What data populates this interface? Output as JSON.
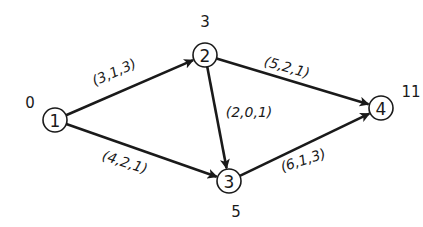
{
  "diagram": {
    "type": "activity-network",
    "nodes": [
      {
        "id": "1",
        "label": "1",
        "time": "0",
        "cx": 55,
        "cy": 120,
        "tx": 30,
        "ty": 103
      },
      {
        "id": "2",
        "label": "2",
        "time": "3",
        "cx": 205,
        "cy": 55,
        "tx": 205,
        "ty": 22
      },
      {
        "id": "3",
        "label": "3",
        "time": "5",
        "cx": 229,
        "cy": 181,
        "tx": 236,
        "ty": 212
      },
      {
        "id": "4",
        "label": "4",
        "time": "11",
        "cx": 381,
        "cy": 108,
        "tx": 411,
        "ty": 92
      }
    ],
    "edges": [
      {
        "from": "1",
        "to": "2",
        "label": "(3,1,3)",
        "lx": 114,
        "ly": 72,
        "rot": -24
      },
      {
        "from": "1",
        "to": "3",
        "label": "(4,2,1)",
        "lx": 125,
        "ly": 162,
        "rot": 18
      },
      {
        "from": "2",
        "to": "3",
        "label": "(2,0,1)",
        "lx": 249,
        "ly": 112,
        "rot": 0
      },
      {
        "from": "2",
        "to": "4",
        "label": "(5,2,1)",
        "lx": 287,
        "ly": 67,
        "rot": 16
      },
      {
        "from": "3",
        "to": "4",
        "label": "(6,1,3)",
        "lx": 303,
        "ly": 160,
        "rot": -18
      }
    ],
    "node_radius": 12,
    "stroke_color": "#1a1a1a",
    "background": "#ffffff"
  }
}
